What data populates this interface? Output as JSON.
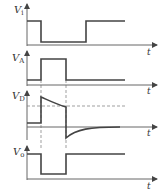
{
  "diagram": {
    "type": "timing-diagram",
    "time_axis_label": "t",
    "colors": {
      "waveform": "#444444",
      "axis": "#666666",
      "dashed": "#777777",
      "background": "#ffffff"
    },
    "signals": [
      {
        "id": "vi",
        "label": "V",
        "subscript": "i",
        "description": "input: high, steps low at t1, returns high at t2'"
      },
      {
        "id": "va",
        "label": "V",
        "subscript": "A",
        "description": "pulse: low, high between t1 and t2, then low"
      },
      {
        "id": "vd",
        "label": "V",
        "subscript": "D",
        "description": "positive spike at t1 decaying toward dashed threshold; negative spike at t2 decaying to zero"
      },
      {
        "id": "vo",
        "label": "V",
        "subscript": "o",
        "description": "output: high, low between t1 and t2, then high"
      }
    ],
    "markers": [
      {
        "name": "t1",
        "x": 41
      },
      {
        "name": "t2",
        "x": 66
      }
    ]
  }
}
